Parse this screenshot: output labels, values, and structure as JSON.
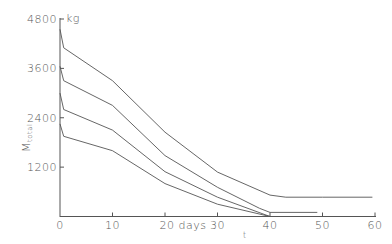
{
  "chart_data": {
    "type": "line",
    "title": "",
    "xlabel": "t",
    "ylabel": "M_total",
    "x_unit": "days",
    "y_unit": "kg",
    "xlim": [
      0,
      60
    ],
    "ylim": [
      0,
      4800
    ],
    "x_ticks": [
      0,
      10,
      20,
      30,
      40,
      50,
      60
    ],
    "y_ticks": [
      1200,
      2400,
      3600,
      4800
    ],
    "x_tick_labels": [
      "0",
      "10",
      "20 days",
      "30",
      "40",
      "50",
      "60"
    ],
    "y_tick_labels": [
      "1200",
      "2400",
      "3600",
      "4800"
    ],
    "grid": false,
    "legend": null,
    "series": [
      {
        "name": "curve-1",
        "x": [
          0,
          0.7,
          10,
          20,
          30,
          40,
          43,
          50,
          59.5
        ],
        "y": [
          4550,
          4100,
          3300,
          2050,
          1080,
          520,
          470,
          470,
          470
        ]
      },
      {
        "name": "curve-2",
        "x": [
          0,
          0.7,
          10,
          20,
          30,
          38,
          40,
          49
        ],
        "y": [
          3650,
          3300,
          2700,
          1480,
          710,
          200,
          100,
          100
        ]
      },
      {
        "name": "curve-3",
        "x": [
          0,
          0.7,
          10,
          20,
          30,
          40
        ],
        "y": [
          3000,
          2600,
          2100,
          1090,
          470,
          0
        ]
      },
      {
        "name": "curve-4",
        "x": [
          0,
          0.7,
          10,
          20,
          30,
          40
        ],
        "y": [
          2250,
          1950,
          1600,
          800,
          300,
          0
        ]
      }
    ]
  },
  "axis": {
    "y_unit_label": "kg",
    "y_label_main": "M",
    "y_label_sub": "total",
    "x_label": "t",
    "origin_label": "0"
  },
  "colors": {
    "line": "#555555",
    "text": "#555555",
    "background": "#ffffff"
  }
}
